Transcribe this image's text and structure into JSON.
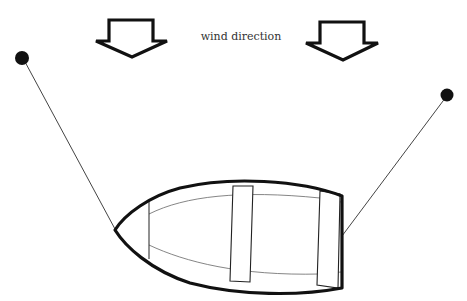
{
  "diagram": {
    "title_label": "wind direction",
    "colors": {
      "stroke": "#111111",
      "thin_stroke": "#444444",
      "text": "#333333",
      "background": "#ffffff"
    },
    "elements": [
      {
        "name": "wind-arrow-left",
        "type": "arrow",
        "direction": "down"
      },
      {
        "name": "wind-arrow-right",
        "type": "arrow",
        "direction": "down"
      },
      {
        "name": "anchor-left",
        "type": "mooring-point"
      },
      {
        "name": "anchor-right",
        "type": "mooring-point"
      },
      {
        "name": "boat",
        "type": "rowboat",
        "seats": 2
      }
    ]
  }
}
